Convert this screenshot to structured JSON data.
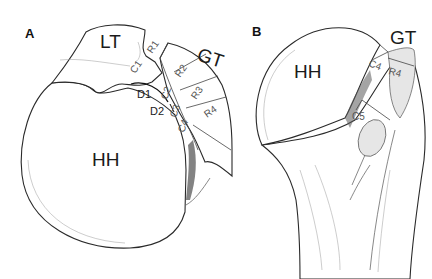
{
  "figure": {
    "panels": [
      {
        "id": "A",
        "label": "A",
        "structures": {
          "lesser_tuberosity": "LT",
          "greater_tuberosity": "GT",
          "humeral_head": "HH"
        },
        "segments": {
          "c1": "C1",
          "c2": "C2",
          "c3": "C3",
          "c4": "C4",
          "r1": "R1",
          "r2": "R2",
          "r3": "R3",
          "r4": "R4"
        },
        "markers": {
          "d1": "D1",
          "d2": "D2"
        }
      },
      {
        "id": "B",
        "label": "B",
        "structures": {
          "humeral_head": "HH",
          "greater_tuberosity": "GT"
        },
        "segments": {
          "c4": "C4",
          "r4": "R4",
          "c5": "C5"
        }
      }
    ]
  }
}
